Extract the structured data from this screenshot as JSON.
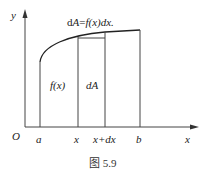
{
  "figure": {
    "caption": "图 5.9",
    "top_formula": {
      "d": "d",
      "A": "A",
      "eq": "=",
      "f": "f",
      "x_paren": "(x)",
      "dx": "dx."
    },
    "region_labels": {
      "fx": "f(x)",
      "dA": "dA"
    },
    "axis_labels": {
      "y": "y",
      "x": "x",
      "origin": "O"
    },
    "tick_labels": {
      "a": "a",
      "x": "x",
      "xdx": "x+dx",
      "b": "b"
    },
    "colors": {
      "line": "#333333",
      "background": "#ffffff"
    }
  }
}
